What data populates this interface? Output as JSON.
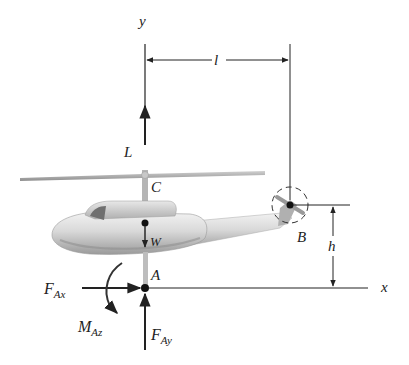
{
  "figure": {
    "colors": {
      "line": "#222222",
      "body_light": "#e6e6e6",
      "body_mid": "#b8b8b8",
      "body_dark": "#8a8a8a",
      "background": "#ffffff"
    },
    "axes": {
      "y_label": "y",
      "x_label": "x"
    },
    "dimensions": {
      "horizontal": "l",
      "vertical": "h"
    },
    "points": {
      "C": "C",
      "A": "A",
      "B": "B"
    },
    "forces": {
      "lift": "L",
      "weight": "W",
      "fax_main": "F",
      "fax_sub": "Ax",
      "fay_main": "F",
      "fay_sub": "Ay",
      "maz_main": "M",
      "maz_sub": "Az"
    }
  }
}
